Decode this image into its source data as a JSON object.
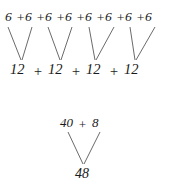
{
  "diagram": {
    "background_color": "#ffffff",
    "line_color": "#595959",
    "text_color": "#1a1a1a",
    "groups": [
      {
        "name": "addition-grouping-6s-to-12s",
        "top_row": {
          "expression": "6 + 6 + 6 + 6 + 6 + 6 + 6 + 6",
          "terms": [
            "6",
            "6",
            "6",
            "6",
            "6",
            "6",
            "6",
            "6"
          ],
          "operator": "+",
          "term_count": 8,
          "term_value": 6
        },
        "bottom_row": {
          "expression": "12 + 12 + 12 + 12",
          "terms": [
            "12",
            "12",
            "12",
            "12"
          ],
          "operator": "+",
          "term_count": 4,
          "term_value": 12
        },
        "branches": 4,
        "branch_description": "each pair of 6s combines into one 12"
      },
      {
        "name": "addition-grouping-40-and-8-to-48",
        "top_row": {
          "expression": "40 + 8",
          "terms": [
            "40",
            "8"
          ],
          "operator": "+",
          "term_count": 2
        },
        "bottom_row": {
          "expression": "48",
          "terms": [
            "48"
          ],
          "term_count": 1
        },
        "branches": 1,
        "branch_description": "40 and 8 combine into 48"
      }
    ],
    "top_terms": [
      {
        "label": "6",
        "x": 5,
        "y": 10
      },
      {
        "label": "+",
        "x": 16,
        "y": 11
      },
      {
        "label": "6",
        "x": 25,
        "y": 10
      },
      {
        "label": "+",
        "x": 36,
        "y": 11
      },
      {
        "label": "6",
        "x": 45,
        "y": 10
      },
      {
        "label": "+",
        "x": 56,
        "y": 11
      },
      {
        "label": "6",
        "x": 65,
        "y": 10
      },
      {
        "label": "+",
        "x": 76,
        "y": 11
      },
      {
        "label": "6",
        "x": 85,
        "y": 10
      },
      {
        "label": "+",
        "x": 96,
        "y": 11
      },
      {
        "label": "6",
        "x": 105,
        "y": 10
      },
      {
        "label": "+",
        "x": 116,
        "y": 11
      },
      {
        "label": "6",
        "x": 125,
        "y": 10
      },
      {
        "label": "+",
        "x": 136,
        "y": 11
      },
      {
        "label": "6",
        "x": 145,
        "y": 10
      }
    ],
    "mid_terms": [
      {
        "label": "12",
        "x": 10,
        "y": 62
      },
      {
        "label": "+",
        "x": 33,
        "y": 64
      },
      {
        "label": "12",
        "x": 48,
        "y": 62
      },
      {
        "label": "+",
        "x": 71,
        "y": 64
      },
      {
        "label": "12",
        "x": 86,
        "y": 62
      },
      {
        "label": "+",
        "x": 109,
        "y": 64
      },
      {
        "label": "12",
        "x": 124,
        "y": 62
      }
    ],
    "lower_top_terms": [
      {
        "label": "40",
        "x": 60,
        "y": 116
      },
      {
        "label": "+",
        "x": 78,
        "y": 118
      },
      {
        "label": "8",
        "x": 92,
        "y": 116
      }
    ],
    "lower_bottom_terms": [
      {
        "label": "48",
        "x": 75,
        "y": 167
      }
    ],
    "connector_lines": [
      {
        "name": "branch-1-left",
        "x1": 8,
        "y1": 27,
        "x2": 21,
        "y2": 60
      },
      {
        "name": "branch-1-right",
        "x1": 32,
        "y1": 27,
        "x2": 22,
        "y2": 60
      },
      {
        "name": "branch-2-left",
        "x1": 48,
        "y1": 27,
        "x2": 60,
        "y2": 60
      },
      {
        "name": "branch-2-right",
        "x1": 72,
        "y1": 27,
        "x2": 61,
        "y2": 60
      },
      {
        "name": "branch-3-left",
        "x1": 89,
        "y1": 27,
        "x2": 95,
        "y2": 60
      },
      {
        "name": "branch-3-right",
        "x1": 114,
        "y1": 27,
        "x2": 96,
        "y2": 60
      },
      {
        "name": "branch-4-left",
        "x1": 130,
        "y1": 27,
        "x2": 135,
        "y2": 60
      },
      {
        "name": "branch-4-right",
        "x1": 155,
        "y1": 27,
        "x2": 136,
        "y2": 60
      },
      {
        "name": "branch-5-left",
        "x1": 68,
        "y1": 132,
        "x2": 83,
        "y2": 164
      },
      {
        "name": "branch-5-right",
        "x1": 100,
        "y1": 132,
        "x2": 84,
        "y2": 164
      }
    ]
  }
}
